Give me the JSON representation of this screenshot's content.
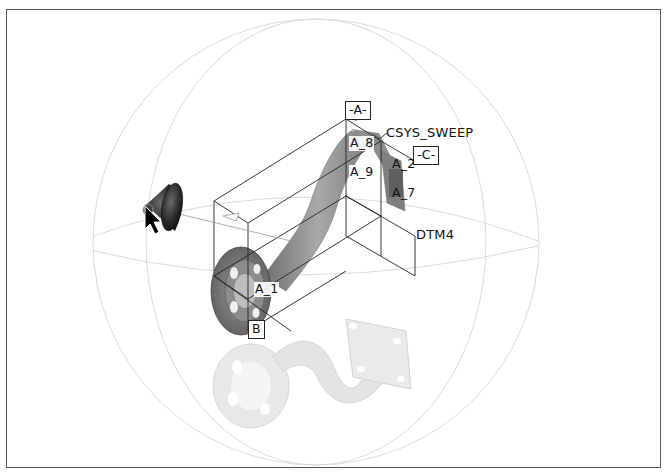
{
  "viewport": {
    "background": "#ffffff",
    "border_color": "#555555"
  },
  "model": {
    "description": "Swept pipe bracket with round flange and rectangular mounting flange, with shadow reflection",
    "part_color": "#8a8a8a",
    "shadow_color": "#e2e2e2"
  },
  "spin_sphere": {
    "color": "#d8d8d8"
  },
  "datums": {
    "axes": [
      {
        "id": "axis-a1",
        "label": "A_1"
      },
      {
        "id": "axis-a2",
        "label": "A_2"
      },
      {
        "id": "axis-a7",
        "label": "A_7"
      },
      {
        "id": "axis-a8",
        "label": "A_8"
      },
      {
        "id": "axis-a9",
        "label": "A_9"
      }
    ],
    "planes": [
      {
        "id": "plane-a",
        "tag": "-A-"
      },
      {
        "id": "plane-b",
        "tag": "B"
      },
      {
        "id": "plane-c",
        "tag": "-C-"
      },
      {
        "id": "plane-dtm4",
        "label": "DTM4"
      }
    ],
    "csys": {
      "label": "CSYS_SWEEP"
    }
  },
  "light_source": {
    "icon": "spotlight-icon"
  },
  "cursor": {
    "icon": "arrow-cursor-icon"
  }
}
